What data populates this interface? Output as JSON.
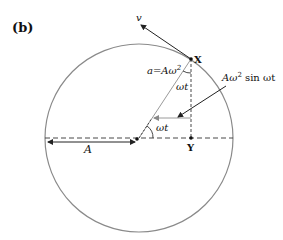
{
  "figure": {
    "panel_label": "(b)",
    "labels": {
      "velocity": "v",
      "point_x": "X",
      "point_y": "Y",
      "radius": "A",
      "acceleration": "a=Aω",
      "acceleration_sup": "2",
      "angle_top": "ωt",
      "angle_bottom": "ωt",
      "component_prefix": "Aω",
      "component_sup": "2",
      "component_suffix": " sin ωt"
    },
    "colors": {
      "circle": "#8a8a8a",
      "lines": "#222222",
      "grey_lines": "#9a9a9a"
    }
  }
}
